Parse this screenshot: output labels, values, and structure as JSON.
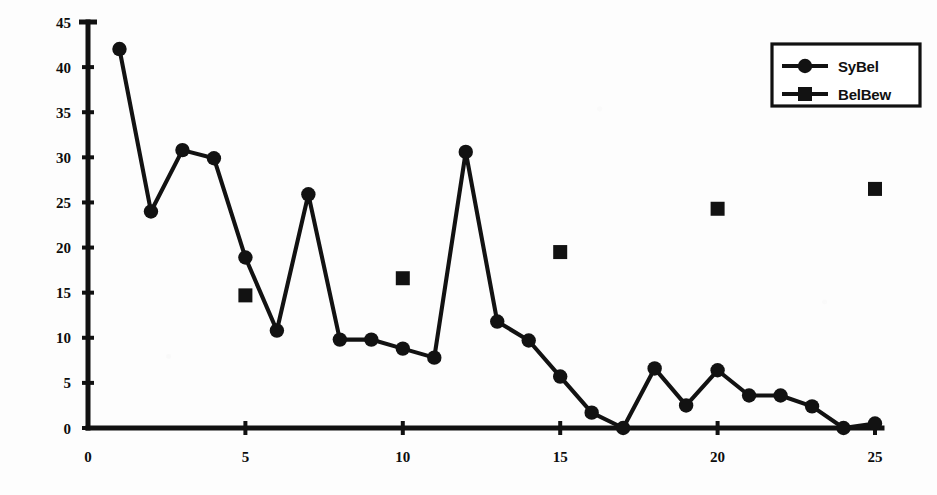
{
  "chart_data": {
    "type": "line",
    "title": "",
    "subtitle": "",
    "xlabel": "",
    "ylabel": "",
    "xlim": [
      0,
      25
    ],
    "ylim": [
      0,
      45
    ],
    "x_ticks": [
      0,
      5,
      10,
      15,
      20,
      25
    ],
    "y_ticks": [
      0,
      5,
      10,
      15,
      20,
      25,
      30,
      35,
      40,
      45
    ],
    "x_tick_labels": [
      "0",
      "5",
      "10",
      "15",
      "20",
      "25"
    ],
    "y_tick_labels": [
      "0",
      "5",
      "10",
      "15",
      "20",
      "25",
      "30",
      "35",
      "40",
      "45"
    ],
    "grid": false,
    "legend_position": "top-right",
    "series": [
      {
        "name": "SyBel",
        "marker": "circle",
        "connected": true,
        "color": "#121212",
        "x": [
          1,
          2,
          3,
          4,
          5,
          6,
          7,
          8,
          9,
          10,
          11,
          12,
          13,
          14,
          15,
          16,
          17,
          18,
          19,
          20,
          21,
          22,
          23,
          24,
          25
        ],
        "values": [
          42.0,
          24.0,
          30.8,
          29.9,
          18.9,
          10.8,
          25.9,
          9.8,
          9.8,
          8.8,
          7.8,
          30.6,
          11.8,
          9.7,
          5.7,
          1.7,
          0.0,
          6.6,
          2.5,
          6.4,
          3.6,
          3.6,
          2.4,
          0.0,
          0.5
        ]
      },
      {
        "name": "BelBew",
        "marker": "square",
        "connected": false,
        "color": "#121212",
        "x": [
          5,
          10,
          15,
          20,
          25
        ],
        "values": [
          14.7,
          16.6,
          19.5,
          24.3,
          26.5
        ]
      }
    ]
  },
  "legend": {
    "entries": [
      {
        "label": "SyBel",
        "marker": "circle"
      },
      {
        "label": "BelBew",
        "marker": "square"
      }
    ]
  },
  "colors": {
    "ink": "#121212",
    "axis": "#111111",
    "background": "#ffffff"
  }
}
